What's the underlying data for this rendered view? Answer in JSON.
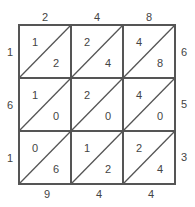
{
  "top_digits": [
    "2",
    "4",
    "8"
  ],
  "right_digits": [
    "6",
    "5",
    "3"
  ],
  "left_digits": [
    "1",
    "6",
    "1"
  ],
  "bottom_digits": [
    "9",
    "4",
    "4"
  ],
  "cells": [
    [
      {
        "tens": "1",
        "ones": "2"
      },
      {
        "tens": "2",
        "ones": "4"
      },
      {
        "tens": "4",
        "ones": "8"
      }
    ],
    [
      {
        "tens": "1",
        "ones": "0"
      },
      {
        "tens": "2",
        "ones": "0"
      },
      {
        "tens": "4",
        "ones": "0"
      }
    ],
    [
      {
        "tens": "0",
        "ones": "6"
      },
      {
        "tens": "1",
        "ones": "2"
      },
      {
        "tens": "2",
        "ones": "4"
      }
    ]
  ],
  "colors": {
    "line": "#555555",
    "text": "#444444"
  }
}
